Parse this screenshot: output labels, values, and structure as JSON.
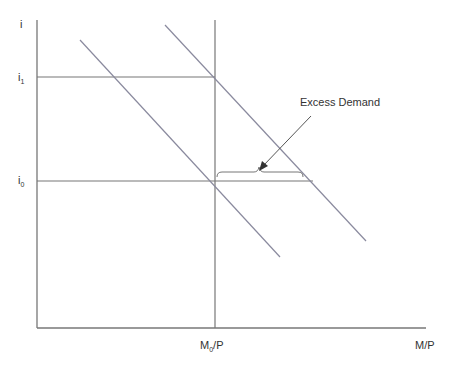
{
  "diagram": {
    "y_axis_label": "i",
    "x_axis_label": "M/P",
    "y_ticks": [
      {
        "base": "i",
        "sub": "1"
      },
      {
        "base": "i",
        "sub": "0"
      }
    ],
    "x_ticks": [
      {
        "base": "M",
        "sub": "0",
        "suffix": "/P"
      }
    ],
    "annotation": "Excess Demand",
    "colors": {
      "axes": "#777777",
      "curves": "#8a8a9e",
      "text": "#333333"
    }
  }
}
